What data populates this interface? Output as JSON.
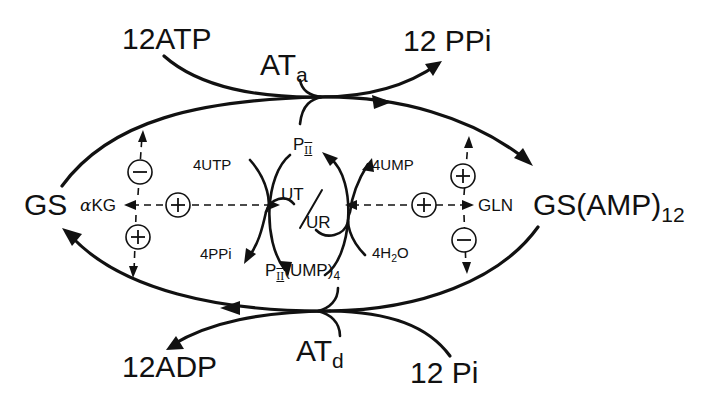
{
  "diagram": {
    "title": "",
    "nodes": {
      "gs": "GS",
      "gs_amp_main": "GS(AMP)",
      "gs_amp_sub": "12",
      "atp": "12ATP",
      "ppi_top": "12 PPi",
      "at_a_main": "AT",
      "at_a_sub": "a",
      "adp": "12ADP",
      "pi_bottom": "12 Pi",
      "at_d_main": "AT",
      "at_d_sub": "d",
      "akg_alpha": "α",
      "akg_rest": "KG",
      "gln": "GLN",
      "pii_top_main": "P",
      "pii_top_sub": "II",
      "pii_ump_main": "P",
      "pii_ump_sub": "II",
      "pii_ump_rest": "(UMP)",
      "pii_ump_sub2": "4",
      "utp": "4UTP",
      "ppi_small": "4PPi",
      "ump": "4UMP",
      "h2o_pre": "4H",
      "h2o_sub": "2",
      "h2o_post": "O",
      "ut": "UT",
      "ur": "UR"
    },
    "regulators": [
      {
        "id": "akg-to-top",
        "sign": "−",
        "from": "αKG",
        "to": "adenylylation arc (top)"
      },
      {
        "id": "akg-to-bottom",
        "sign": "+",
        "from": "αKG",
        "to": "deadenylylation arc (bottom)"
      },
      {
        "id": "akg-ut-ur",
        "sign": "+",
        "from": "UT/UR",
        "to": "αKG"
      },
      {
        "id": "gln-ut-ur",
        "sign": "+",
        "from": "UT/UR",
        "to": "GLN"
      },
      {
        "id": "gln-to-top",
        "sign": "+",
        "from": "GLN",
        "to": "adenylylation arc (top)"
      },
      {
        "id": "gln-to-bottom",
        "sign": "−",
        "from": "GLN",
        "to": "deadenylylation arc (bottom)"
      }
    ],
    "colors": {
      "ink": "#111111",
      "background": "#ffffff"
    }
  }
}
